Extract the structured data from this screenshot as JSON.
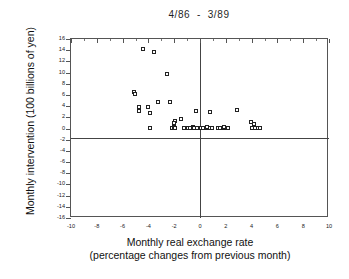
{
  "figure": {
    "title": "4/86  -  3/89",
    "background": "#ffffff",
    "frame_color": "#555555",
    "marker_color": "#222222"
  },
  "chart_data": {
    "type": "scatter",
    "title": "4/86  -  3/89",
    "xlabel_line1": "Monthly real exchange rate",
    "xlabel_line2": "(percentage changes from previous month)",
    "ylabel": "Monthly intervention (100 billions of yen)",
    "xlim": [
      -10,
      10
    ],
    "ylim": [
      -16,
      16
    ],
    "xticks": [
      -10,
      -8,
      -6,
      -4,
      -2,
      0,
      2,
      4,
      6,
      8,
      10
    ],
    "xtick_labels": [
      "-10",
      "-8",
      "-6",
      "-4",
      "-2",
      "0",
      "2",
      "4",
      "6",
      "8",
      "10"
    ],
    "xminor_ticks": [
      -9,
      -7,
      -5,
      -3,
      -1,
      1,
      3,
      5,
      7,
      9
    ],
    "yticks": [
      16,
      14,
      12,
      10,
      8,
      6,
      4,
      2,
      0,
      -2,
      -4,
      -6,
      -8,
      -10,
      -12,
      -14,
      -16
    ],
    "ytick_labels": [
      "16",
      "14",
      "12",
      "10",
      "8",
      "6",
      "4",
      "2",
      "0",
      "-2",
      "-4",
      "-6",
      "-8",
      "-10",
      "-12",
      "-14",
      "-16"
    ],
    "grid": false,
    "legend": null,
    "zero_lines": {
      "horizontal": 0,
      "vertical": 0
    },
    "marker": "open-square",
    "n_points": 45,
    "points": [
      {
        "x": -4.4,
        "y": 14.2
      },
      {
        "x": -3.5,
        "y": 13.6
      },
      {
        "x": -2.5,
        "y": 9.6
      },
      {
        "x": -5.1,
        "y": 6.4
      },
      {
        "x": -5.0,
        "y": 6.0
      },
      {
        "x": -3.2,
        "y": 4.6
      },
      {
        "x": -2.3,
        "y": 4.7
      },
      {
        "x": -4.7,
        "y": 3.8
      },
      {
        "x": -4.0,
        "y": 3.7
      },
      {
        "x": -4.7,
        "y": 3.0
      },
      {
        "x": -3.8,
        "y": 2.7
      },
      {
        "x": -0.3,
        "y": 3.1
      },
      {
        "x": 0.8,
        "y": 2.9
      },
      {
        "x": 2.9,
        "y": 3.3
      },
      {
        "x": -1.4,
        "y": 1.6
      },
      {
        "x": -1.9,
        "y": 1.2
      },
      {
        "x": -2.0,
        "y": 0.9
      },
      {
        "x": 4.0,
        "y": 1.1
      },
      {
        "x": 4.2,
        "y": 0.8
      },
      {
        "x": -3.8,
        "y": 0.0
      },
      {
        "x": -2.1,
        "y": 0.0
      },
      {
        "x": -2.0,
        "y": 0.1
      },
      {
        "x": -1.9,
        "y": 0.0
      },
      {
        "x": -1.2,
        "y": 0.0
      },
      {
        "x": -0.9,
        "y": 0.0
      },
      {
        "x": -0.7,
        "y": 0.0
      },
      {
        "x": -0.5,
        "y": 0.1
      },
      {
        "x": -0.4,
        "y": 0.0
      },
      {
        "x": -0.2,
        "y": 0.0
      },
      {
        "x": 0.1,
        "y": 0.0
      },
      {
        "x": 0.3,
        "y": 0.0
      },
      {
        "x": 0.5,
        "y": 0.0
      },
      {
        "x": 0.6,
        "y": 0.1
      },
      {
        "x": 0.8,
        "y": 0.0
      },
      {
        "x": 1.0,
        "y": 0.0
      },
      {
        "x": 1.4,
        "y": 0.0
      },
      {
        "x": 1.6,
        "y": 0.0
      },
      {
        "x": 1.8,
        "y": 0.0
      },
      {
        "x": 1.9,
        "y": 0.1
      },
      {
        "x": 2.1,
        "y": 0.0
      },
      {
        "x": 2.2,
        "y": 0.0
      },
      {
        "x": 4.1,
        "y": 0.0
      },
      {
        "x": 4.3,
        "y": 0.0
      },
      {
        "x": 4.5,
        "y": 0.0
      },
      {
        "x": 4.7,
        "y": 0.0
      }
    ]
  }
}
